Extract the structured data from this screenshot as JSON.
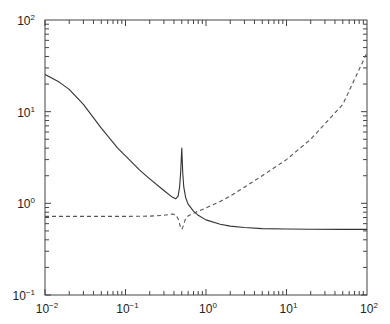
{
  "chart_data": {
    "type": "line",
    "title": "",
    "xlabel": "",
    "ylabel": "",
    "xscale": "log",
    "yscale": "log",
    "xlim": [
      0.01,
      100
    ],
    "ylim": [
      0.1,
      100
    ],
    "grid": false,
    "legend": null,
    "x_ticks": [
      {
        "base": "10",
        "exp": "−2",
        "value": 0.01
      },
      {
        "base": "10",
        "exp": "−1",
        "value": 0.1
      },
      {
        "base": "10",
        "exp": "0",
        "value": 1
      },
      {
        "base": "10",
        "exp": "1",
        "value": 10
      },
      {
        "base": "10",
        "exp": "2",
        "value": 100
      }
    ],
    "y_ticks": [
      {
        "base": "10",
        "exp": "−1",
        "value": 0.1
      },
      {
        "base": "10",
        "exp": "0",
        "value": 1
      },
      {
        "base": "10",
        "exp": "1",
        "value": 10
      },
      {
        "base": "10",
        "exp": "2",
        "value": 100
      }
    ],
    "series": [
      {
        "name": "solid",
        "style": "solid",
        "color": "#333333",
        "x": [
          0.01,
          0.015,
          0.02,
          0.03,
          0.05,
          0.08,
          0.1,
          0.15,
          0.2,
          0.3,
          0.38,
          0.42,
          0.45,
          0.47,
          0.485,
          0.495,
          0.5,
          0.505,
          0.515,
          0.53,
          0.56,
          0.6,
          0.7,
          0.8,
          1.0,
          1.5,
          2,
          3,
          5,
          10,
          20,
          50,
          100
        ],
        "y": [
          25.5,
          21,
          17.5,
          12,
          6.6,
          4.0,
          3.3,
          2.3,
          1.85,
          1.38,
          1.17,
          1.12,
          1.2,
          1.5,
          2.2,
          3.3,
          4.0,
          3.2,
          2.1,
          1.5,
          1.15,
          0.98,
          0.82,
          0.74,
          0.66,
          0.59,
          0.565,
          0.545,
          0.53,
          0.525,
          0.522,
          0.52,
          0.52
        ]
      },
      {
        "name": "dashed",
        "style": "dashed",
        "color": "#555555",
        "x": [
          0.01,
          0.05,
          0.1,
          0.2,
          0.3,
          0.38,
          0.42,
          0.45,
          0.48,
          0.5,
          0.52,
          0.55,
          0.6,
          0.7,
          0.8,
          1.0,
          1.5,
          2,
          3,
          5,
          10,
          20,
          50,
          100
        ],
        "y": [
          0.72,
          0.72,
          0.72,
          0.725,
          0.74,
          0.765,
          0.75,
          0.68,
          0.56,
          0.52,
          0.56,
          0.66,
          0.73,
          0.78,
          0.82,
          0.89,
          1.05,
          1.2,
          1.5,
          2.0,
          3.0,
          5.0,
          12,
          44
        ]
      }
    ]
  }
}
